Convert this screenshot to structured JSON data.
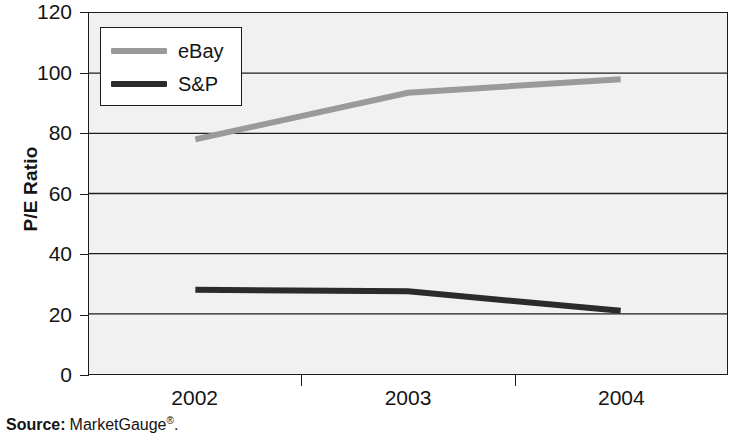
{
  "chart_data": {
    "type": "line",
    "title": "",
    "xlabel": "",
    "ylabel": "P/E Ratio",
    "categories": [
      "2002",
      "2003",
      "2004"
    ],
    "series": [
      {
        "name": "eBay",
        "values": [
          78,
          93.5,
          98
        ],
        "color": "#9a9a9a"
      },
      {
        "name": "S&P",
        "values": [
          28,
          27.5,
          21
        ],
        "color": "#2b2b2b"
      }
    ],
    "ylim": [
      0,
      120
    ],
    "yticks": [
      0,
      20,
      40,
      60,
      80,
      100,
      120
    ],
    "ytick_labels": [
      "0",
      "20",
      "40",
      "60",
      "80",
      "100",
      "120"
    ],
    "grid": true,
    "grid_axis": "y",
    "legend_position": "top-left",
    "plot_background": "#f1f1f1",
    "frame_color": "#1c1c1c"
  },
  "axes": {
    "y_title": "P/E Ratio"
  },
  "legend": {
    "entries": [
      {
        "label": "eBay"
      },
      {
        "label": "S&P"
      }
    ]
  },
  "source": {
    "label": "Source:",
    "value": "MarketGauge",
    "mark": "®",
    "period": "."
  }
}
